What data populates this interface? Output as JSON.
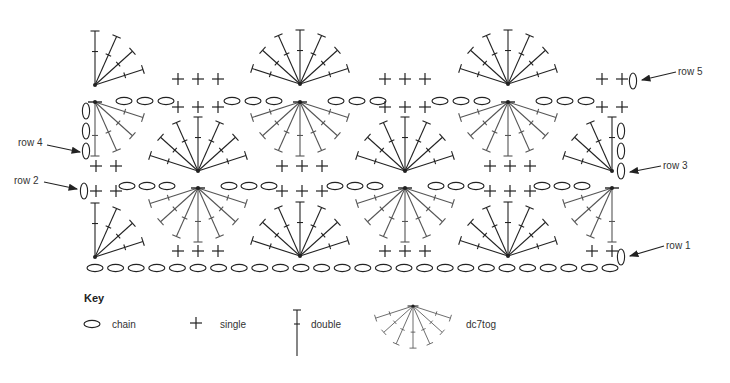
{
  "row_labels": [
    {
      "id": "row-5",
      "text": "row 5",
      "x": 678,
      "y": 66,
      "arrow": [
        676,
        72,
        642,
        80
      ]
    },
    {
      "id": "row-4",
      "text": "row 4",
      "x": 18,
      "y": 137,
      "arrow": [
        47,
        145,
        80,
        152
      ]
    },
    {
      "id": "row-3",
      "text": "row 3",
      "x": 663,
      "y": 160,
      "arrow": [
        661,
        166,
        630,
        172
      ]
    },
    {
      "id": "row-2",
      "text": "row 2",
      "x": 14,
      "y": 175,
      "arrow": [
        44,
        182,
        77,
        189
      ]
    },
    {
      "id": "row-1",
      "text": "row 1",
      "x": 666,
      "y": 240,
      "arrow": [
        664,
        246,
        630,
        256
      ]
    }
  ],
  "key": {
    "title": "Key",
    "items": [
      {
        "symbol": "chain",
        "label": "chain"
      },
      {
        "symbol": "single",
        "label": "single"
      },
      {
        "symbol": "double",
        "label": "double"
      },
      {
        "symbol": "dc7tog",
        "label": "dc7tog"
      }
    ]
  },
  "stitches": {
    "chains_h": [
      {
        "row": 1,
        "y": 268,
        "xs": [
          95,
          115.6,
          136.2,
          156.8,
          177.4,
          198,
          218.6,
          239.2,
          259.8,
          280.4,
          301,
          321.6,
          342.2,
          362.8,
          383.4,
          404,
          424.6,
          445.2,
          465.8,
          486.4,
          507,
          527.6,
          548.2,
          568.8,
          589.4,
          610
        ]
      },
      {
        "row": 2,
        "y": 186,
        "xs": [
          127,
          147,
          167,
          229,
          249,
          269,
          335,
          355,
          375,
          436,
          456,
          476,
          542,
          562,
          582
        ]
      },
      {
        "row": 4,
        "y": 101,
        "xs": [
          124,
          145,
          166,
          232,
          253,
          274,
          336,
          357,
          378,
          440,
          461,
          482,
          544,
          565,
          586
        ]
      }
    ],
    "chains_v": [
      {
        "row": 1,
        "x": 621,
        "ys": [
          257
        ]
      },
      {
        "row": 2,
        "x": 84,
        "ys": [
          191
        ]
      },
      {
        "row": 3,
        "x": 621,
        "ys": [
          131,
          151,
          171
        ]
      },
      {
        "row": 4,
        "x": 86,
        "ys": [
          111,
          131,
          151
        ]
      },
      {
        "row": 5,
        "x": 633,
        "ys": [
          81
        ]
      }
    ],
    "singles": [
      {
        "row": 1,
        "y": 251,
        "xs": [
          178,
          198,
          218,
          385,
          405,
          425,
          592,
          612
        ]
      },
      {
        "row": 2,
        "y": 191,
        "xs": [
          96,
          116,
          282,
          302,
          322,
          490,
          510,
          530
        ]
      },
      {
        "row": 3,
        "y": 166,
        "xs": [
          96,
          116,
          282,
          302,
          322,
          490,
          510,
          530
        ]
      },
      {
        "row": 4,
        "y": 107,
        "xs": [
          178,
          198,
          218,
          385,
          405,
          425,
          602,
          622
        ]
      },
      {
        "row": 5,
        "y": 79,
        "xs": [
          178,
          198,
          218,
          385,
          405,
          425,
          602,
          622
        ]
      }
    ],
    "fans": [
      {
        "row": 5,
        "x": 300,
        "y": 84,
        "dir": "up",
        "type": "full"
      },
      {
        "row": 5,
        "x": 508,
        "y": 84,
        "dir": "up",
        "type": "full"
      },
      {
        "row": 5,
        "x": 95,
        "y": 85,
        "dir": "up",
        "type": "quarter-right"
      },
      {
        "row": 4,
        "x": 300,
        "y": 102,
        "dir": "down",
        "type": "full"
      },
      {
        "row": 4,
        "x": 508,
        "y": 102,
        "dir": "down",
        "type": "full"
      },
      {
        "row": 4,
        "x": 95,
        "y": 102,
        "dir": "down",
        "type": "quarter-right"
      },
      {
        "row": 3,
        "x": 198,
        "y": 171,
        "dir": "up",
        "type": "full"
      },
      {
        "row": 3,
        "x": 405,
        "y": 171,
        "dir": "up",
        "type": "full"
      },
      {
        "row": 3,
        "x": 612,
        "y": 171,
        "dir": "up",
        "type": "quarter-left"
      },
      {
        "row": 2,
        "x": 198,
        "y": 188,
        "dir": "down",
        "type": "full"
      },
      {
        "row": 2,
        "x": 405,
        "y": 188,
        "dir": "down",
        "type": "full"
      },
      {
        "row": 2,
        "x": 612,
        "y": 188,
        "dir": "down",
        "type": "quarter-left"
      },
      {
        "row": 1,
        "x": 300,
        "y": 256,
        "dir": "up",
        "type": "full"
      },
      {
        "row": 1,
        "x": 508,
        "y": 256,
        "dir": "up",
        "type": "full"
      },
      {
        "row": 1,
        "x": 95,
        "y": 257,
        "dir": "up",
        "type": "quarter-right"
      }
    ]
  },
  "colors": {
    "ink": "#222222",
    "ink_light": "#555555",
    "background": "#ffffff"
  }
}
